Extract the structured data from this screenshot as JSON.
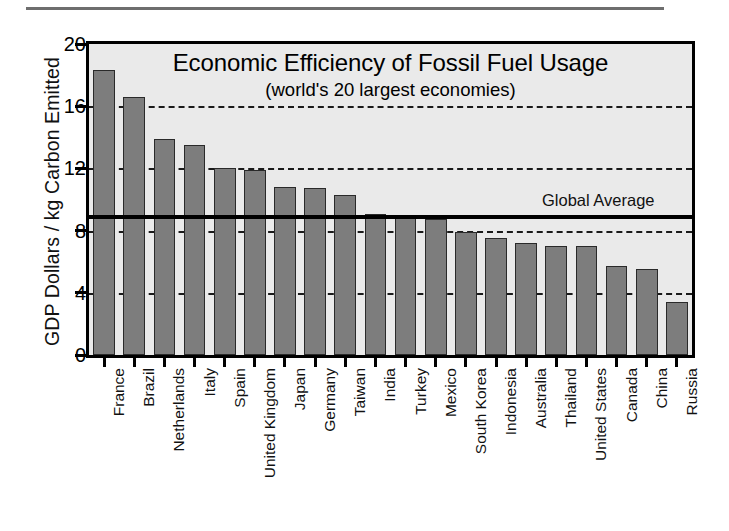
{
  "chart_data": {
    "type": "bar",
    "title": "Economic Efficiency of Fossil Fuel Usage",
    "subtitle": "(world's 20 largest economies)",
    "xlabel": "",
    "ylabel": "GDP Dollars / kg Carbon Emitted",
    "ylim": [
      0,
      20
    ],
    "yticks": [
      0,
      4,
      8,
      12,
      16,
      20
    ],
    "ytick_labels": [
      "0",
      "4",
      "8",
      "12",
      "16",
      "20"
    ],
    "grid": "horizontal-dashed",
    "gridlines": [
      4,
      8,
      12,
      16
    ],
    "legend": "none",
    "categories": [
      "France",
      "Brazil",
      "Netherlands",
      "Italy",
      "Spain",
      "United Kingdom",
      "Japan",
      "Germany",
      "Taiwan",
      "India",
      "Turkey",
      "Mexico",
      "South Korea",
      "Indonesia",
      "Australia",
      "Thailand",
      "United States",
      "Canada",
      "China",
      "Russia"
    ],
    "values": [
      18.3,
      16.6,
      13.9,
      13.5,
      12.05,
      11.9,
      10.8,
      10.75,
      10.3,
      9.1,
      8.8,
      8.75,
      7.9,
      7.5,
      7.2,
      7.0,
      7.0,
      5.75,
      5.55,
      3.4
    ],
    "annotations": [
      {
        "name": "global-average",
        "label": "Global Average",
        "value": 8.9,
        "style": "solid-thick-horizontal-line"
      }
    ],
    "colors": {
      "bar_fill": "#7d7d7d",
      "bar_edge": "#2a2a2a",
      "plot_background": "#eaeaea",
      "axis": "#000000",
      "gridline": "#1a1a1a",
      "page_background": "#ffffff",
      "top_rule": "#6e6e6e"
    }
  }
}
